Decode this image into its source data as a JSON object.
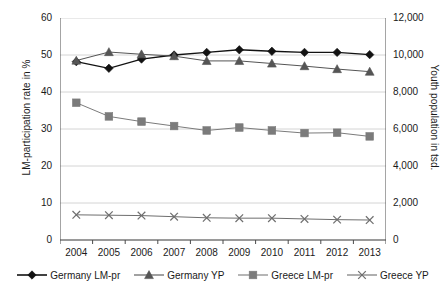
{
  "chart_data": {
    "type": "line",
    "title": "",
    "subtitle": "",
    "xlabel": "",
    "ylabel": "LM-participation rate in %",
    "y2label": "Youth population in tsd.",
    "categories": [
      "2004",
      "2005",
      "2006",
      "2007",
      "2008",
      "2009",
      "2010",
      "2011",
      "2012",
      "2013"
    ],
    "ylim": [
      0,
      60
    ],
    "yticks": [
      "0",
      "10",
      "20",
      "30",
      "40",
      "50",
      "60"
    ],
    "y2lim": [
      0,
      12000
    ],
    "y2ticks": [
      "0",
      "2,000",
      "4,000",
      "6,000",
      "8,000",
      "10,000",
      "12,000"
    ],
    "grid": true,
    "legend_position": "bottom",
    "series": [
      {
        "name": "Germany LM-pr",
        "axis": "left",
        "marker": "diamond",
        "color": "#121212",
        "values": [
          48.2,
          46.4,
          48.9,
          50.0,
          50.7,
          51.4,
          51.0,
          50.7,
          50.7,
          50.1
        ]
      },
      {
        "name": "Germany YP",
        "axis": "right",
        "marker": "triangle",
        "color": "#555555",
        "values": [
          9700,
          10160,
          10040,
          9940,
          9680,
          9680,
          9540,
          9400,
          9240,
          9100
        ]
      },
      {
        "name": "Greece LM-pr",
        "axis": "left",
        "marker": "square",
        "color": "#7b7b7b",
        "values": [
          37.1,
          33.4,
          32.0,
          30.8,
          29.6,
          30.4,
          29.6,
          28.9,
          29.0,
          28.0
        ]
      },
      {
        "name": "Greece YP",
        "axis": "right",
        "marker": "cross",
        "color": "#6e6e6e",
        "values": [
          1360,
          1340,
          1320,
          1260,
          1200,
          1180,
          1180,
          1140,
          1100,
          1080
        ]
      }
    ]
  },
  "legend": {
    "items": [
      {
        "label": "Germany LM-pr"
      },
      {
        "label": "Germany YP"
      },
      {
        "label": "Greece LM-pr"
      },
      {
        "label": "Greece YP"
      }
    ]
  }
}
